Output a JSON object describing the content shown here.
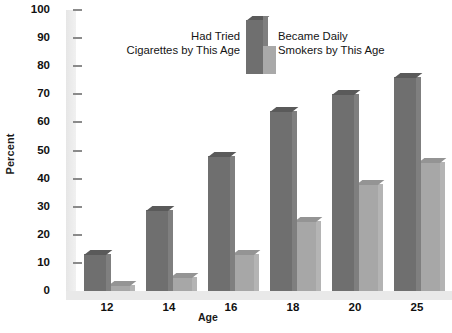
{
  "chart_data": {
    "type": "bar",
    "title": "",
    "xlabel": "Age",
    "ylabel": "Percent",
    "categories": [
      "12",
      "14",
      "16",
      "18",
      "20",
      "25"
    ],
    "series": [
      {
        "name": "Had Tried Cigarettes by This Age",
        "color": "#6f6f6f",
        "values": [
          13,
          29,
          48,
          64,
          70,
          76
        ]
      },
      {
        "name": "Became Daily Smokers by This Age",
        "color": "#a7a7a7",
        "values": [
          2,
          5,
          13,
          25,
          38,
          46
        ]
      }
    ],
    "ylim": [
      0,
      100
    ],
    "y_ticks": [
      "0",
      "10",
      "20",
      "30",
      "40",
      "50",
      "60",
      "70",
      "80",
      "90",
      "100"
    ],
    "grid": false,
    "legend_position": "top-center"
  },
  "legend": {
    "left_line1": "Had Tried",
    "left_line2": "Cigarettes by This Age",
    "right_line1": "Became Daily",
    "right_line2": "Smokers by This Age"
  },
  "axes": {
    "y_title": "Percent",
    "x_title": "Age"
  }
}
